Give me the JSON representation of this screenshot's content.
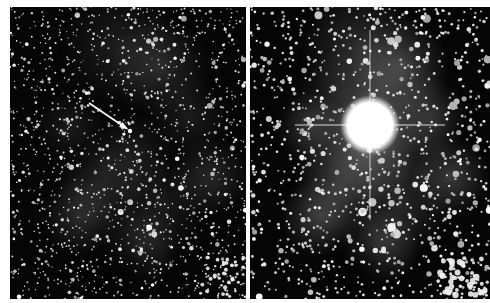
{
  "figure": {
    "panels": [
      {
        "id": "left",
        "description": "Star field with faint nebulosity before outburst; arrow points to progenitor star",
        "arrow": {
          "from": [
            79,
            96
          ],
          "to": [
            116,
            121
          ],
          "color": "#ffffff"
        },
        "marked_star": [
          120,
          124
        ]
      },
      {
        "id": "right",
        "description": "Same star field with a very bright saturated star (nova) with diffraction spikes",
        "bright_star": {
          "center": [
            120,
            118
          ],
          "radius": 30,
          "color": "#ffffff"
        }
      }
    ],
    "colors": {
      "background": "#ffffff",
      "sky": "#050505",
      "stars": "#ffffff",
      "nebula": "#6e6e6e"
    }
  }
}
